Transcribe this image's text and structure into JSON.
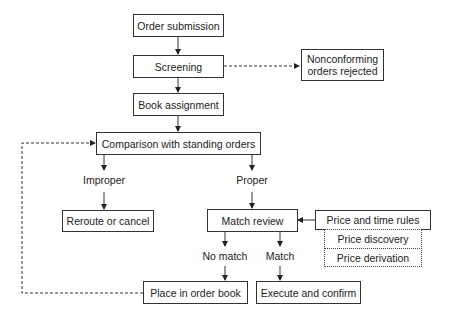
{
  "diagram": {
    "type": "flowchart",
    "nodes": {
      "order_submission": "Order submission",
      "screening": "Screening",
      "nonconforming": "Nonconforming orders rejected",
      "book_assignment": "Book assignment",
      "comparison": "Comparison with standing orders",
      "reroute": "Reroute or cancel",
      "match_review": "Match review",
      "price_time_rules": "Price and time rules",
      "price_discovery": "Price discovery",
      "price_derivation": "Price derivation",
      "place_in_book": "Place in order book",
      "execute_confirm": "Execute and confirm"
    },
    "labels": {
      "improper": "Improper",
      "proper": "Proper",
      "no_match": "No match",
      "match": "Match"
    },
    "edges": [
      {
        "from": "Order submission",
        "to": "Screening",
        "style": "solid"
      },
      {
        "from": "Screening",
        "to": "Nonconforming orders rejected",
        "style": "dashed"
      },
      {
        "from": "Screening",
        "to": "Book assignment",
        "style": "solid"
      },
      {
        "from": "Book assignment",
        "to": "Comparison with standing orders",
        "style": "solid"
      },
      {
        "from": "Comparison with standing orders",
        "to": "Reroute or cancel",
        "label": "Improper",
        "style": "solid"
      },
      {
        "from": "Comparison with standing orders",
        "to": "Match review",
        "label": "Proper",
        "style": "solid"
      },
      {
        "from": "Price and time rules",
        "to": "Match review",
        "style": "solid"
      },
      {
        "from": "Match review",
        "to": "Place in order book",
        "label": "No match",
        "style": "solid"
      },
      {
        "from": "Match review",
        "to": "Execute and confirm",
        "label": "Match",
        "style": "solid"
      },
      {
        "from": "Place in order book",
        "to": "Comparison with standing orders",
        "style": "dashed"
      }
    ]
  }
}
